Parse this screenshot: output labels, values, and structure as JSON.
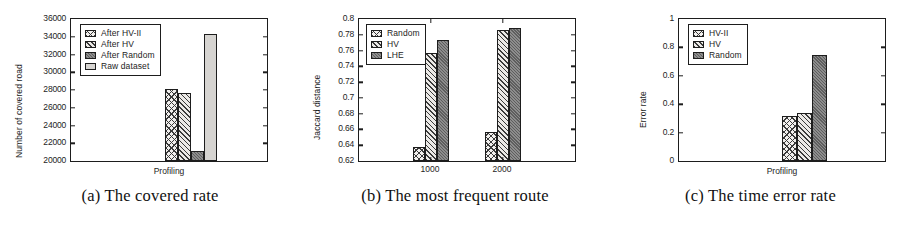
{
  "figure": {
    "panels": [
      {
        "id": "a",
        "caption": "(a) The covered rate",
        "ylabel": "Number of covered road",
        "xlabel": "Profiling",
        "yticks": [
          "20000",
          "22000",
          "24000",
          "26000",
          "28000",
          "30000",
          "32000",
          "34000",
          "36000"
        ],
        "legend": [
          {
            "label": "After HV-II",
            "pattern": "crosshatch"
          },
          {
            "label": "After HV",
            "pattern": "hatch"
          },
          {
            "label": "After Random",
            "pattern": "dark"
          },
          {
            "label": "Raw dataset",
            "pattern": "light"
          }
        ]
      },
      {
        "id": "b",
        "caption": "(b) The most frequent route",
        "ylabel": "Jaccard distance",
        "xlabel": "",
        "yticks": [
          "0.62",
          "0.64",
          "0.66",
          "0.68",
          "0.7",
          "0.72",
          "0.74",
          "0.76",
          "0.78",
          "0.8"
        ],
        "xticks": [
          "1000",
          "2000"
        ],
        "legend": [
          {
            "label": "Random",
            "pattern": "crosshatch"
          },
          {
            "label": "HV",
            "pattern": "hatch"
          },
          {
            "label": "LHE",
            "pattern": "dark"
          }
        ]
      },
      {
        "id": "c",
        "caption": "(c) The time error rate",
        "ylabel": "Error rate",
        "xlabel": "Profiling",
        "yticks": [
          "0",
          "0.2",
          "0.4",
          "0.6",
          "0.8",
          "1"
        ],
        "legend": [
          {
            "label": "HV-II",
            "pattern": "crosshatch"
          },
          {
            "label": "HV",
            "pattern": "hatch"
          },
          {
            "label": "Random",
            "pattern": "dark"
          }
        ]
      }
    ]
  },
  "chart_data": [
    {
      "type": "bar",
      "panel": "a",
      "title": "(a) The covered rate",
      "xlabel": "Profiling",
      "ylabel": "Number of covered road",
      "categories": [
        "Profiling"
      ],
      "ylim": [
        20000,
        36000
      ],
      "ytick_values": [
        20000,
        22000,
        24000,
        26000,
        28000,
        30000,
        32000,
        34000,
        36000
      ],
      "grid": false,
      "legend_position": "upper-left",
      "series": [
        {
          "name": "After HV-II",
          "values": [
            28100
          ],
          "pattern": "crosshatch"
        },
        {
          "name": "After HV",
          "values": [
            27700
          ],
          "pattern": "hatch"
        },
        {
          "name": "After Random",
          "values": [
            21150
          ],
          "pattern": "dark"
        },
        {
          "name": "Raw dataset",
          "values": [
            34350
          ],
          "pattern": "light"
        }
      ]
    },
    {
      "type": "bar",
      "panel": "b",
      "title": "(b) The most frequent route",
      "xlabel": "",
      "ylabel": "Jaccard distance",
      "categories": [
        "1000",
        "2000"
      ],
      "ylim": [
        0.62,
        0.8
      ],
      "ytick_values": [
        0.62,
        0.64,
        0.66,
        0.68,
        0.7,
        0.72,
        0.74,
        0.76,
        0.78,
        0.8
      ],
      "grid": false,
      "legend_position": "upper-left",
      "series": [
        {
          "name": "Random",
          "values": [
            0.638,
            0.657
          ],
          "pattern": "crosshatch"
        },
        {
          "name": "HV",
          "values": [
            0.757,
            0.786
          ],
          "pattern": "hatch"
        },
        {
          "name": "LHE",
          "values": [
            0.774,
            0.789
          ],
          "pattern": "dark"
        }
      ]
    },
    {
      "type": "bar",
      "panel": "c",
      "title": "(c) The time error rate",
      "xlabel": "Profiling",
      "ylabel": "Error rate",
      "categories": [
        "Profiling"
      ],
      "ylim": [
        0,
        1
      ],
      "ytick_values": [
        0,
        0.2,
        0.4,
        0.6,
        0.8,
        1
      ],
      "grid": false,
      "legend_position": "upper-left",
      "series": [
        {
          "name": "HV-II",
          "values": [
            0.315
          ],
          "pattern": "crosshatch"
        },
        {
          "name": "HV",
          "values": [
            0.34
          ],
          "pattern": "hatch"
        },
        {
          "name": "Random",
          "values": [
            0.748
          ],
          "pattern": "dark"
        }
      ]
    }
  ]
}
